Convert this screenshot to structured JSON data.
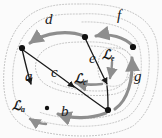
{
  "figure": {
    "background": "#fbfbfb",
    "width": 162,
    "height": 138,
    "colors": {
      "edge_black": "#1a1a1a",
      "edge_gray": "#8e8e8e",
      "dotted_gray": "#bdbdbd",
      "node_fill": "#111111",
      "label_text": "#1a1a1a"
    }
  },
  "nodes": [
    {
      "id": "n_left",
      "label": "",
      "x": 22,
      "y": 48
    },
    {
      "id": "n_top",
      "label": "",
      "x": 85,
      "y": 37
    },
    {
      "id": "n_right",
      "label": "",
      "x": 133,
      "y": 47
    },
    {
      "id": "n_bottom",
      "label": "",
      "x": 108,
      "y": 110
    },
    {
      "id": "n_small",
      "label": "",
      "x": 47,
      "y": 108
    }
  ],
  "edges": [
    {
      "id": "edge_a",
      "label": "a",
      "color": "#1a1a1a",
      "style": "solid",
      "direction": "up",
      "from": "n_small",
      "to": "n_left"
    },
    {
      "id": "edge_b",
      "label": "b",
      "color": "#8e8e8e",
      "style": "solid",
      "direction": "left",
      "from": "n_bottom",
      "to": "n_small"
    },
    {
      "id": "edge_c",
      "label": "c",
      "color": "#1a1a1a",
      "style": "solid",
      "direction": "down",
      "from": "n_left",
      "to": "n_bottom"
    },
    {
      "id": "edge_d",
      "label": "d",
      "color": "#8e8e8e",
      "style": "solid",
      "direction": "left",
      "from": "n_top",
      "to": "n_left"
    },
    {
      "id": "edge_e",
      "label": "e",
      "color": "#1a1a1a",
      "style": "solid",
      "direction": "down",
      "from": "n_top",
      "to": "n_bottom"
    },
    {
      "id": "edge_f",
      "label": "f",
      "color": "#8e8e8e",
      "style": "solid",
      "direction": "left",
      "from": "n_right",
      "to": "n_top"
    },
    {
      "id": "edge_g",
      "label": "g",
      "color": "#8e8e8e",
      "style": "solid",
      "direction": "up",
      "from": "n_bottom",
      "to": "n_right"
    }
  ],
  "edge_labels": [
    {
      "text": "a",
      "x": 28,
      "y": 77
    },
    {
      "text": "b",
      "x": 64,
      "y": 112
    },
    {
      "text": "c",
      "x": 54,
      "y": 73
    },
    {
      "text": "d",
      "x": 48,
      "y": 20
    },
    {
      "text": "e",
      "x": 92,
      "y": 59
    },
    {
      "text": "f",
      "x": 119,
      "y": 16
    },
    {
      "text": "g",
      "x": 137,
      "y": 77
    }
  ],
  "loop_labels": [
    {
      "id": "loop_a",
      "script": "ℒ",
      "sub": "a",
      "x": 16,
      "y": 104
    },
    {
      "id": "loop_c",
      "script": "ℒ",
      "sub": "c",
      "x": 77,
      "y": 77
    },
    {
      "id": "loop_e",
      "script": "ℒ",
      "sub": "e",
      "x": 105,
      "y": 54
    }
  ],
  "regions": [
    {
      "id": "region_outer",
      "style": "dotted",
      "color": "#bdbdbd",
      "note": "outermost dotted boundary enclosing whole graph"
    },
    {
      "id": "region_a",
      "style": "dotted",
      "color": "#bdbdbd",
      "note": "dotted loop around edges a, b, c, d"
    },
    {
      "id": "region_c",
      "style": "dotted",
      "color": "#bdbdbd",
      "note": "dotted loop around inner region c"
    },
    {
      "id": "region_e",
      "style": "dotted",
      "color": "#bdbdbd",
      "note": "small dotted loop around e on the right"
    }
  ]
}
